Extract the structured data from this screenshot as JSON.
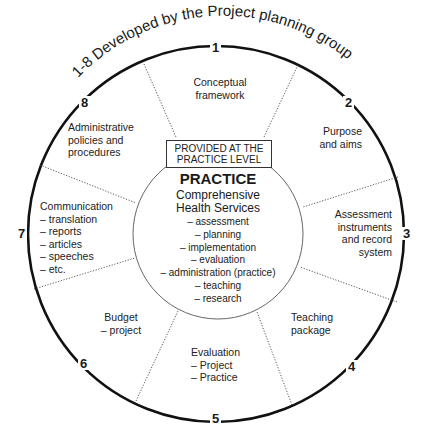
{
  "title": "1-8 Developed by the Project planning group",
  "center": {
    "box_label_line1": "PROVIDED AT THE",
    "box_label_line2": "PRACTICE LEVEL",
    "heading": "PRACTICE",
    "subheading_line1": "Comprehensive",
    "subheading_line2": "Health Services",
    "items": [
      "– assessment",
      "– planning",
      "– implementation",
      "– evaluation",
      "– administration (practice)",
      "– teaching",
      "– research"
    ]
  },
  "segments": [
    {
      "number": "1",
      "lines": [
        "Conceptual",
        "framework"
      ]
    },
    {
      "number": "2",
      "lines": [
        "Purpose",
        "and aims"
      ]
    },
    {
      "number": "3",
      "lines": [
        "Assessment",
        "instruments",
        "and record",
        "system"
      ]
    },
    {
      "number": "4",
      "lines": [
        "Teaching",
        "package"
      ]
    },
    {
      "number": "5",
      "lines": [
        "Evaluation",
        "– Project",
        "– Practice"
      ]
    },
    {
      "number": "6",
      "lines": [
        "Budget",
        "– project"
      ]
    },
    {
      "number": "7",
      "lines": [
        "Communication",
        "– translation",
        "– reports",
        "– articles",
        "– speeches",
        "– etc."
      ]
    },
    {
      "number": "8",
      "lines": [
        "Administrative",
        "policies and",
        "procedures"
      ]
    }
  ]
}
